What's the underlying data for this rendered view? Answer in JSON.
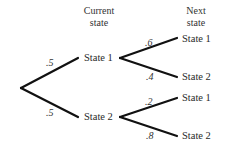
{
  "headers": {
    "current_line1": "Current",
    "current_line2": "state",
    "next_line1": "Next",
    "next_line2": "state"
  },
  "tree": {
    "root_branches": [
      {
        "prob": ".5",
        "label": "State 1"
      },
      {
        "prob": ".5",
        "label": "State 2"
      }
    ],
    "state1_branches": [
      {
        "prob": ".6",
        "label": "State 1"
      },
      {
        "prob": ".4",
        "label": "State 2"
      }
    ],
    "state2_branches": [
      {
        "prob": ".2",
        "label": "State 1"
      },
      {
        "prob": ".8",
        "label": "State 2"
      }
    ]
  },
  "colors": {
    "line": "#111111",
    "text": "#2a2a2a"
  }
}
